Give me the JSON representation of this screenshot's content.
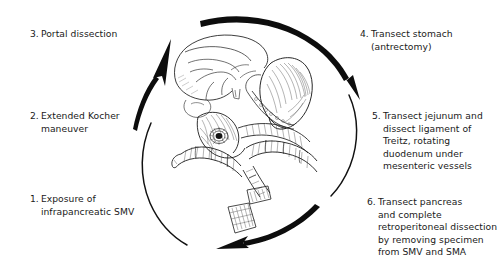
{
  "figure": {
    "background_color": "#ffffff",
    "ink_color": "#1c1c1c",
    "arrow_color": "#0d0d0d"
  },
  "steps": [
    {
      "number": "1.",
      "text": "Exposure of\ninfrapancreatic SMV",
      "position": "left-lower"
    },
    {
      "number": "2.",
      "text": "Extended Kocher\nmaneuver",
      "position": "left-middle"
    },
    {
      "number": "3.",
      "text": "Portal dissection",
      "position": "left-upper"
    },
    {
      "number": "4.",
      "text": "Transect stomach\n(antrectomy)",
      "position": "right-upper"
    },
    {
      "number": "5.",
      "text": "Transect jejunum and\ndissect ligament of\nTreitz, rotating\nduodenum under\nmesenteric vessels",
      "position": "right-middle"
    },
    {
      "number": "6.",
      "text": "Transect pancreas\nand complete\nretroperitoneal dissection\nby removing specimen\nfrom SMV and SMA",
      "position": "right-lower"
    }
  ],
  "arrows": [
    {
      "name": "ascending-left-arrow",
      "direction": "up-right",
      "has_head": true
    },
    {
      "name": "top-sweep-arrow",
      "direction": "right-down",
      "has_head": true
    },
    {
      "name": "bottom-sweep-arrow",
      "direction": "right-to-left",
      "has_head": true
    },
    {
      "name": "right-connector-arc",
      "direction": "vertical",
      "has_head": false
    },
    {
      "name": "left-descending-arc",
      "direction": "vertical",
      "has_head": false
    }
  ],
  "illustration": {
    "name": "upper-abdominal-anatomy-line-drawing",
    "style": "pen-and-ink stipple hatching",
    "structures": [
      "liver",
      "stomach with transection staple line",
      "pancreas head and body",
      "duodenum",
      "small bowel loops",
      "resected specimen segments"
    ]
  }
}
